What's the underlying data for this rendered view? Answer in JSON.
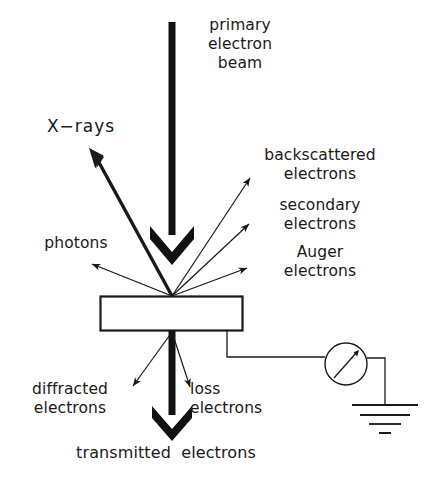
{
  "diagram": {
    "type": "schematic",
    "background_color": "#ffffff",
    "ink_color": "#1a1a1a",
    "labels": {
      "primary_beam": "primary\nelectron\nbeam",
      "xrays": "X−rays",
      "backscattered": "backscattered\nelectrons",
      "secondary": "secondary\nelectrons",
      "auger": "Auger\nelectrons",
      "photons": "photons",
      "diffracted": "diffracted\nelectrons",
      "loss": "loss\nelectrons",
      "transmitted": "transmitted  electrons"
    },
    "elements": {
      "specimen_name": "specimen-slab",
      "meter_name": "current-meter",
      "ground_name": "ground-symbol",
      "wire_name": "specimen-current-wire"
    },
    "geometry": {
      "interaction_point": [
        172,
        296
      ],
      "specimen_rect": [
        100,
        296,
        143,
        35
      ],
      "beam_shaft": [
        172,
        22,
        172,
        255
      ],
      "meter_center": [
        346,
        364
      ],
      "meter_radius": 21,
      "ground_x": 385,
      "ground_top_y": 405
    }
  }
}
